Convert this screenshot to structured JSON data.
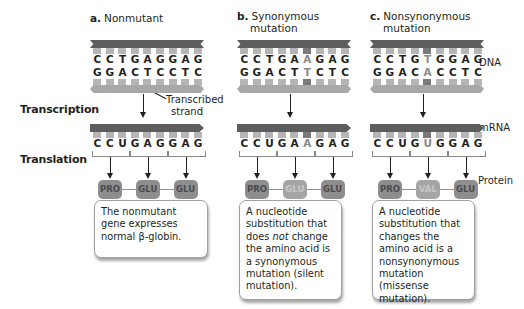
{
  "row_labels": {
    "transcription": "Transcription",
    "translation": "Translation"
  },
  "side_labels": {
    "dna": "DNA",
    "mrna": "mRNA",
    "protein": "Protein"
  },
  "annotation": {
    "transcribed_strand_line1": "Transcribed",
    "transcribed_strand_line2": "strand"
  },
  "colors": {
    "coding_strand": "#5d5d5d",
    "template_strand": "#a8a8a8",
    "amino_acid": "#8e8e8e",
    "highlight": "#8a8a8a"
  },
  "panels": [
    {
      "letter": "a.",
      "title_line1": "Nonmutant",
      "title_line2": "",
      "dna_top": [
        "C",
        "C",
        "T",
        "G",
        "A",
        "G",
        "G",
        "A",
        "G"
      ],
      "dna_bottom": [
        "G",
        "G",
        "A",
        "C",
        "T",
        "C",
        "C",
        "T",
        "C"
      ],
      "mrna": [
        "C",
        "C",
        "U",
        "G",
        "A",
        "G",
        "G",
        "A",
        "G"
      ],
      "highlight_index": -1,
      "amino_acids": [
        "PRO",
        "GLU",
        "GLU"
      ],
      "changed_amino_acid_index": -1,
      "description": "The nonmutant gene expresses normal β-globin."
    },
    {
      "letter": "b.",
      "title_line1": "Synonymous",
      "title_line2": "mutation",
      "dna_top": [
        "C",
        "C",
        "T",
        "G",
        "A",
        "A",
        "G",
        "A",
        "G"
      ],
      "dna_bottom": [
        "G",
        "G",
        "A",
        "C",
        "T",
        "T",
        "C",
        "T",
        "C"
      ],
      "mrna": [
        "C",
        "C",
        "U",
        "G",
        "A",
        "A",
        "G",
        "A",
        "G"
      ],
      "highlight_index": 5,
      "amino_acids": [
        "PRO",
        "GLU",
        "GLU"
      ],
      "changed_amino_acid_index": 1,
      "description_parts": [
        "A nucleotide substitution that does ",
        "not",
        " change the amino acid is a synonymous mutation (silent mutation)."
      ]
    },
    {
      "letter": "c.",
      "title_line1": "Nonsynonymous",
      "title_line2": "mutation",
      "dna_top": [
        "C",
        "C",
        "T",
        "G",
        "T",
        "G",
        "G",
        "A",
        "G"
      ],
      "dna_bottom": [
        "G",
        "G",
        "A",
        "C",
        "A",
        "C",
        "C",
        "T",
        "C"
      ],
      "mrna": [
        "C",
        "C",
        "U",
        "G",
        "U",
        "G",
        "G",
        "A",
        "G"
      ],
      "highlight_index": 4,
      "amino_acids": [
        "PRO",
        "VAL",
        "GLU"
      ],
      "changed_amino_acid_index": 1,
      "description": "A nucleotide substitution that changes the amino acid is a nonsynonymous mutation (missense mutation)."
    }
  ]
}
